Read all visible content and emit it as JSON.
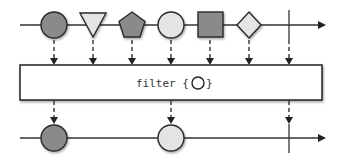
{
  "diagram": {
    "type": "marble-diagram",
    "operator": {
      "name": "filter",
      "label_prefix": "filter {",
      "label_suffix": "}",
      "predicate_shape": "circle-outline"
    },
    "colors": {
      "dark_fill": "#8a8a8a",
      "light_fill": "#e4e4e4",
      "stroke": "#2a2a2a",
      "line": "#333333",
      "box_fill": "#ffffff"
    },
    "input_stream": {
      "items": [
        {
          "shape": "circle",
          "fill": "dark",
          "x": 54
        },
        {
          "shape": "triangle",
          "fill": "light",
          "x": 93
        },
        {
          "shape": "pentagon",
          "fill": "dark",
          "x": 132
        },
        {
          "shape": "circle",
          "fill": "light",
          "x": 171
        },
        {
          "shape": "square",
          "fill": "dark",
          "x": 210
        },
        {
          "shape": "diamond",
          "fill": "light",
          "x": 249
        }
      ],
      "completion_x": 289
    },
    "output_stream": {
      "items": [
        {
          "shape": "circle",
          "fill": "dark",
          "x": 54
        },
        {
          "shape": "circle",
          "fill": "light",
          "x": 171
        }
      ],
      "completion_x": 289
    }
  }
}
